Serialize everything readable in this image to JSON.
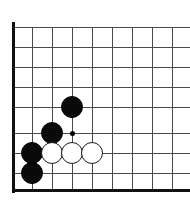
{
  "diagram": {
    "type": "go-board",
    "board": {
      "width_px": 190,
      "height_px": 208,
      "background_color": "#ffffff",
      "grid_color": "#4a4a4a",
      "edge_color": "#111111",
      "grid_spacing_px": 20,
      "origin_x_px": 12,
      "origin_y_px": 27,
      "columns": 9,
      "rows": 9,
      "edges": [
        {
          "side": "left",
          "x": 12,
          "y": 22,
          "length": 171,
          "thickness": 3
        },
        {
          "side": "bottom",
          "x": 12,
          "y": 189,
          "length": 178,
          "thickness": 3
        }
      ],
      "vertical_lines_x": [
        32,
        52,
        72,
        92,
        112,
        132,
        152,
        172
      ],
      "horizontal_lines_y": [
        27,
        47,
        67,
        87,
        107,
        133,
        153,
        173
      ]
    },
    "star_points": [
      {
        "x": 72,
        "y": 133,
        "size_px": 5,
        "color": "#000000"
      }
    ],
    "stones": [
      {
        "color": "black",
        "x": 72,
        "y": 107,
        "radius_px": 11
      },
      {
        "color": "black",
        "x": 52,
        "y": 133,
        "radius_px": 11
      },
      {
        "color": "black",
        "x": 32,
        "y": 153,
        "radius_px": 11
      },
      {
        "color": "black",
        "x": 32,
        "y": 173,
        "radius_px": 11
      },
      {
        "color": "white",
        "x": 52,
        "y": 153,
        "radius_px": 11
      },
      {
        "color": "white",
        "x": 72,
        "y": 153,
        "radius_px": 11
      },
      {
        "color": "white",
        "x": 92,
        "y": 153,
        "radius_px": 11
      }
    ]
  }
}
